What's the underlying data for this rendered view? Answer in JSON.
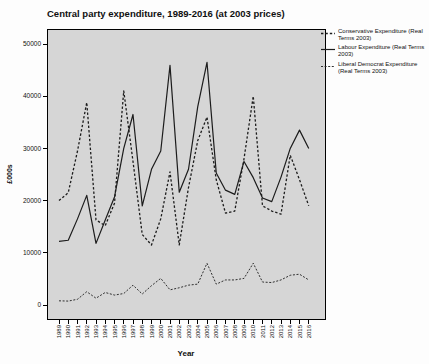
{
  "title": "Central party expenditure, 1989-2016 (at 2003 prices)",
  "chart_data": {
    "type": "line",
    "title": "Central party expenditure, 1989-2016 (at 2003 prices)",
    "xlabel": "Year",
    "ylabel": "£000s",
    "ylim": [
      0,
      50000
    ],
    "yticks": [
      0,
      10000,
      20000,
      30000,
      40000,
      50000
    ],
    "ytick_labels": [
      "0",
      "10000",
      "20000",
      "30000",
      "40000",
      "50000"
    ],
    "grid": false,
    "legend_position": "right",
    "plot_background": "#d6d6d6",
    "line_color": "#1c1c1c",
    "x": [
      1989,
      1990,
      1991,
      1992,
      1993,
      1994,
      1995,
      1996,
      1997,
      1998,
      1999,
      2000,
      2001,
      2002,
      2003,
      2004,
      2005,
      2006,
      2007,
      2008,
      2009,
      2010,
      2011,
      2012,
      2013,
      2014,
      2015,
      2016
    ],
    "series": [
      {
        "name": "Conservative Expenditure (Real Terms 2003)",
        "dash": "2.4 2",
        "width": 1.3,
        "values": [
          20000,
          21500,
          29500,
          38800,
          16300,
          15200,
          19500,
          41000,
          27500,
          13500,
          11500,
          16500,
          25500,
          11500,
          22500,
          31500,
          36000,
          24000,
          17600,
          18000,
          28000,
          40000,
          19000,
          18000,
          17400,
          28700,
          24000,
          19000
        ]
      },
      {
        "name": "Labour Expenditure (Real Terms 2003)",
        "dash": "",
        "width": 1.2,
        "values": [
          12200,
          12400,
          16500,
          21000,
          11800,
          16300,
          20700,
          30000,
          36500,
          19000,
          26000,
          29500,
          45900,
          21600,
          26000,
          38000,
          46500,
          25300,
          22000,
          21200,
          27500,
          24400,
          20500,
          19800,
          24500,
          30000,
          33500,
          30000
        ]
      },
      {
        "name": "Liberal Democrat Expenditure (Real Terms 2003)",
        "dash": "2 1.6",
        "width": 0.9,
        "values": [
          800,
          750,
          1100,
          2550,
          1300,
          2400,
          1900,
          2200,
          3800,
          2100,
          3700,
          5100,
          2900,
          3300,
          3800,
          4000,
          8000,
          4000,
          4800,
          4800,
          5100,
          8000,
          4400,
          4300,
          4800,
          5700,
          5900,
          4800
        ]
      }
    ]
  }
}
